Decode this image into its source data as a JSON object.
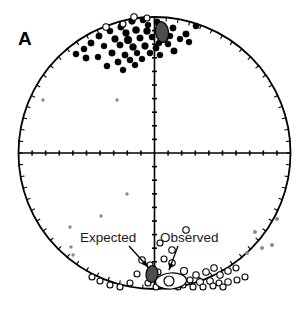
{
  "figure": {
    "panel_letter": "A",
    "type": "stereonet-equal-area-projection",
    "background_color": "#ffffff",
    "outline_color": "#000000"
  },
  "annotations": [
    {
      "id": "expected",
      "label": "Expected",
      "text_x": 80,
      "text_y": 242,
      "arrow_from_x": 129,
      "arrow_from_y": 246,
      "arrow_to_x": 148,
      "arrow_to_y": 267,
      "target_x": 152,
      "target_y": 273
    },
    {
      "id": "observed",
      "label": "Observed",
      "text_x": 160,
      "text_y": 242,
      "arrow_from_x": 178,
      "arrow_from_y": 246,
      "arrow_to_x": 169,
      "arrow_to_y": 270,
      "target_x": 167,
      "target_y": 278
    }
  ],
  "chart_data": {
    "type": "scatter",
    "title": "A",
    "projection": "equal-area lower/upper hemisphere stereonet",
    "xlabel": "",
    "ylabel": "",
    "grid": false,
    "legend_position": "inline-annotations",
    "axis_ranges": {
      "x": [
        -1,
        1
      ],
      "y": [
        -1,
        1
      ]
    },
    "circle": {
      "center_x": 154.5,
      "center_y": 153,
      "radius": 136,
      "stroke": "#000000",
      "stroke_width": 1.8
    },
    "axes_cross": {
      "stroke": "#000000",
      "stroke_width": 1.6,
      "tick_count_per_arm": 9,
      "tick_length": 5
    },
    "perimeter_ticks": {
      "count": 72,
      "length": 4,
      "stroke": "#000000"
    },
    "series": [
      {
        "name": "Normal polarity sites (filled)",
        "marker": "filled-circle",
        "color": "#000000",
        "points": [
          [
            132,
            21,
            3.4
          ],
          [
            143,
            20,
            3.1
          ],
          [
            157,
            22,
            3.2
          ],
          [
            121,
            27,
            3.3
          ],
          [
            110,
            31,
            3.1
          ],
          [
            126,
            33,
            3.4
          ],
          [
            136,
            30,
            3.6
          ],
          [
            147,
            31,
            3.5
          ],
          [
            99,
            36,
            3.2
          ],
          [
            115,
            39,
            3.4
          ],
          [
            128,
            40,
            3.9
          ],
          [
            140,
            38,
            3.3
          ],
          [
            152,
            37,
            3.1
          ],
          [
            163,
            31,
            3.0
          ],
          [
            173,
            28,
            3.2
          ],
          [
            186,
            34,
            3.3
          ],
          [
            196,
            26,
            3.1
          ],
          [
            120,
            45,
            3.2
          ],
          [
            133,
            47,
            3.5
          ],
          [
            145,
            46,
            3.4
          ],
          [
            156,
            48,
            3.2
          ],
          [
            168,
            44,
            3.1
          ],
          [
            104,
            46,
            3.0
          ],
          [
            91,
            43,
            3.2
          ],
          [
            84,
            49,
            3.1
          ],
          [
            112,
            53,
            3.3
          ],
          [
            125,
            55,
            3.2
          ],
          [
            137,
            53,
            3.0
          ],
          [
            150,
            53,
            3.1
          ],
          [
            160,
            55,
            3.0
          ],
          [
            174,
            51,
            3.3
          ],
          [
            98,
            57,
            3.0
          ],
          [
            86,
            58,
            3.2
          ],
          [
            118,
            62,
            3.2
          ],
          [
            130,
            60,
            3.1
          ],
          [
            142,
            59,
            3.0
          ],
          [
            107,
            66,
            3.1
          ],
          [
            76,
            54,
            3.1
          ],
          [
            180,
            39,
            3.0
          ],
          [
            189,
            42,
            3.0
          ],
          [
            165,
            38,
            3.4
          ],
          [
            159,
            43,
            3.0
          ],
          [
            148,
            25,
            3.0
          ],
          [
            170,
            36,
            3.0
          ],
          [
            135,
            65,
            3.0
          ],
          [
            123,
            70,
            3.0
          ]
        ]
      },
      {
        "name": "Reversed polarity sites (open)",
        "marker": "open-circle",
        "color": "#000000",
        "points": [
          [
            134,
            17,
            3.2
          ],
          [
            106,
            27,
            3.2
          ],
          [
            123,
            24,
            3.0
          ],
          [
            147,
            18,
            3.0
          ],
          [
            184,
            271,
            3.5
          ],
          [
            172,
            263,
            3.2
          ],
          [
            196,
            275,
            3.2
          ],
          [
            206,
            272,
            3.3
          ],
          [
            214,
            268,
            3.2
          ],
          [
            220,
            275,
            3.2
          ],
          [
            228,
            271,
            3.2
          ],
          [
            236,
            268,
            3.0
          ],
          [
            190,
            280,
            3.0
          ],
          [
            200,
            282,
            3.4
          ],
          [
            210,
            281,
            3.3
          ],
          [
            219,
            283,
            3.0
          ],
          [
            228,
            282,
            3.2
          ],
          [
            237,
            280,
            3.0
          ],
          [
            245,
            277,
            3.0
          ],
          [
            177,
            280,
            3.0
          ],
          [
            183,
            285,
            3.0
          ],
          [
            193,
            287,
            3.0
          ],
          [
            203,
            287,
            3.0
          ],
          [
            213,
            286,
            3.0
          ],
          [
            223,
            287,
            3.0
          ],
          [
            158,
            272,
            3.0
          ],
          [
            150,
            265,
            3.0
          ],
          [
            142,
            260,
            3.2
          ],
          [
            137,
            274,
            3.0
          ],
          [
            130,
            283,
            3.0
          ],
          [
            120,
            287,
            3.0
          ],
          [
            110,
            285,
            3.0
          ],
          [
            100,
            281,
            3.0
          ],
          [
            92,
            277,
            3.0
          ],
          [
            164,
            259,
            3.0
          ],
          [
            172,
            250,
            3.2
          ],
          [
            160,
            243,
            3.0
          ],
          [
            186,
            230,
            3.2
          ],
          [
            168,
            285,
            3.0
          ],
          [
            178,
            287,
            3.0
          ],
          [
            148,
            283,
            3.0
          ],
          [
            156,
            287,
            3.0
          ]
        ]
      },
      {
        "name": "Low-weight / scattered points (small gray)",
        "marker": "small-gray-dot",
        "color": "#8a8a8a",
        "points": [
          [
            43,
            100,
            1.7
          ],
          [
            117,
            100,
            1.7
          ],
          [
            127,
            194,
            1.7
          ],
          [
            101,
            216,
            1.7
          ],
          [
            70,
            227,
            1.7
          ],
          [
            71,
            247,
            1.7
          ],
          [
            73,
            255,
            1.7
          ],
          [
            255,
            232,
            2.0
          ],
          [
            262,
            248,
            2.0
          ],
          [
            247,
            253,
            2.0
          ],
          [
            272,
            245,
            2.0
          ],
          [
            277,
            219,
            2.0
          ]
        ]
      }
    ],
    "mean_ellipses": [
      {
        "name": "Observed mean (normal polarity) with a95 confidence ellipse",
        "cx": 162,
        "cy": 32,
        "rx": 6.5,
        "ry": 10.5,
        "rotation": -8,
        "fill": "#4d4d4d",
        "stroke": "#000000"
      },
      {
        "name": "Expected direction (reversed polarity)",
        "cx": 152,
        "cy": 274,
        "rx": 6.0,
        "ry": 8.5,
        "rotation": 6,
        "fill": "#4d4d4d",
        "stroke": "#000000"
      },
      {
        "name": "Observed mean (reversed polarity) with a95 confidence ellipse",
        "cx": 171,
        "cy": 281,
        "rx": 15.5,
        "ry": 8.0,
        "rotation": -4,
        "fill": "#ffffff",
        "stroke": "#000000"
      },
      {
        "name": "Observed mean direction point (reversed)",
        "cx": 169,
        "cy": 281,
        "rx": 5.0,
        "ry": 5.0,
        "rotation": 0,
        "fill": "#ffffff",
        "stroke": "#000000"
      }
    ]
  }
}
